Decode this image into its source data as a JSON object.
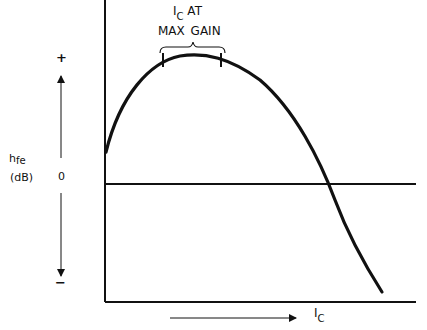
{
  "diagram": {
    "type": "gain-vs-collector-current",
    "annotation": {
      "line1_main": "I",
      "line1_sub": "C",
      "line1_rest": "AT",
      "line2": "MAX GAIN"
    },
    "y_axis": {
      "label_main": "h",
      "label_sub": "fe",
      "unit": "(dB)",
      "zero_label": "0",
      "plus_label": "+",
      "minus_label": "−"
    },
    "x_axis": {
      "label_main": "I",
      "label_sub": "C"
    },
    "colors": {
      "line": "#111111",
      "background": "#ffffff"
    }
  }
}
